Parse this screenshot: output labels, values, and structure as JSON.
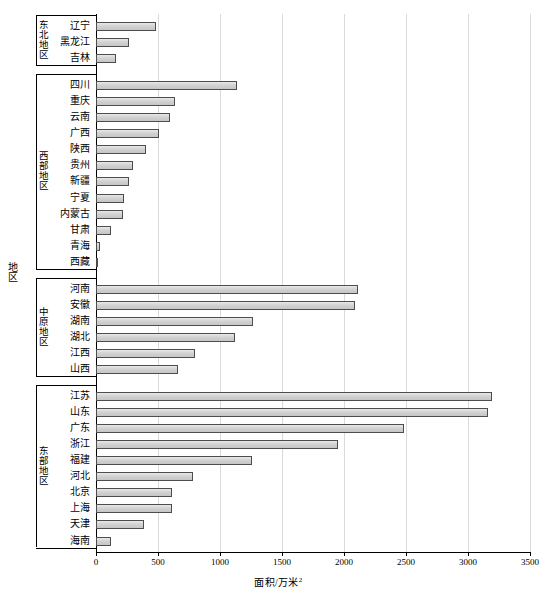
{
  "chart_data": {
    "type": "bar",
    "orientation": "horizontal",
    "title": "",
    "xlabel": "面积/万米²",
    "ylabel": "地区",
    "xlim": [
      0,
      3500
    ],
    "xticks": [
      0,
      500,
      1000,
      1500,
      2000,
      2500,
      3000,
      3500
    ],
    "xtick_labels": [
      "0",
      "500",
      "1000",
      "1500",
      "2000",
      "2500",
      "3000",
      "3500"
    ],
    "grid": true,
    "grid_axis": "x",
    "legend": null,
    "bar_fill": "#d4d4d4",
    "bar_edge": "#4d4d4d",
    "groups": [
      {
        "label": "东北地区",
        "categories": [
          "辽宁",
          "黑龙江",
          "吉林"
        ],
        "values": [
          480,
          270,
          165
        ]
      },
      {
        "label": "西部地区",
        "categories": [
          "四川",
          "重庆",
          "云南",
          "广西",
          "陕西",
          "贵州",
          "新疆",
          "宁夏",
          "内蒙古",
          "甘肃",
          "青海",
          "西藏"
        ],
        "values": [
          1140,
          640,
          600,
          510,
          405,
          300,
          265,
          225,
          215,
          120,
          30,
          12
        ]
      },
      {
        "label": "中原地区",
        "categories": [
          "河南",
          "安徽",
          "湖南",
          "湖北",
          "江西",
          "山西"
        ],
        "values": [
          2115,
          2090,
          1270,
          1120,
          800,
          665
        ]
      },
      {
        "label": "东部地区",
        "categories": [
          "江苏",
          "山东",
          "广东",
          "浙江",
          "福建",
          "河北",
          "北京",
          "上海",
          "天津",
          "海南"
        ],
        "values": [
          3195,
          3165,
          2480,
          1955,
          1260,
          785,
          615,
          615,
          385,
          120
        ]
      }
    ]
  },
  "axis": {
    "x_title": "面积/万米",
    "x_title_sup": "2",
    "y_title": "地区"
  }
}
